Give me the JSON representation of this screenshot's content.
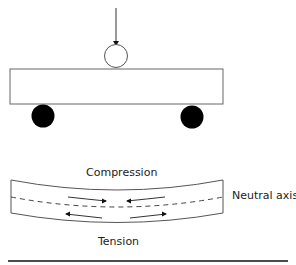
{
  "diagram": {
    "labels": {
      "compression": "Compression",
      "neutral_axis": "Neutral axis",
      "tension": "Tension"
    },
    "elements": {
      "load_arrow": "downward-force-arrow",
      "loading_roller": "open-circle-roller",
      "beam": "rectangular-beam-unloaded",
      "supports": [
        "left-support-roller",
        "right-support-roller"
      ],
      "bent_beam": "bent-beam-with-neutral-axis",
      "compression_arrows": [
        "right-pointing",
        "left-pointing"
      ],
      "tension_arrows": [
        "left-pointing",
        "right-pointing"
      ]
    },
    "colors": {
      "stroke": "#555555",
      "fill_support": "#000000",
      "ground_line": "#111111"
    }
  }
}
